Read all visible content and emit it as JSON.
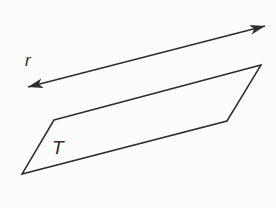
{
  "figure": {
    "background_color": "#fcfcfc",
    "stroke_color": "#2d2d2d",
    "line_r": {
      "label": "r",
      "x1": 28,
      "y1": 87,
      "x2": 265,
      "y2": 26,
      "label_x": 25,
      "label_y": 66
    },
    "shape_T": {
      "label": "T",
      "points": "54,120 261,65 227,121 22,174",
      "label_x": 52,
      "label_y": 154
    }
  }
}
